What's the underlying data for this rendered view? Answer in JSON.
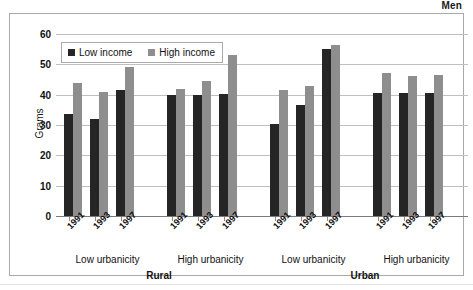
{
  "chart_data": {
    "type": "bar",
    "title": "Men",
    "xlabel": "",
    "ylabel": "Grams",
    "ylim": [
      0,
      60
    ],
    "ytick_step": 10,
    "yticks": [
      "0",
      "10",
      "20",
      "30",
      "40",
      "50",
      "60"
    ],
    "grid": true,
    "legend_position": "top-left-inside",
    "legend": [
      "Low income",
      "High income"
    ],
    "colors": {
      "low_income": "#252525",
      "high_income": "#8e8e8e",
      "gridline": "#bfbfbf",
      "frame": "#a9a9a9",
      "text": "#111111"
    },
    "categories": [
      "1991",
      "1993",
      "1997",
      "1991",
      "1993",
      "1997",
      "1991",
      "1993",
      "1997",
      "1991",
      "1993",
      "1997"
    ],
    "series": [
      {
        "name": "Low income",
        "values": [
          33.5,
          32.0,
          41.5,
          40.0,
          40.0,
          40.2,
          30.2,
          36.5,
          55.0,
          40.5,
          40.5,
          40.5
        ]
      },
      {
        "name": "High income",
        "values": [
          44.0,
          40.8,
          49.0,
          41.8,
          44.5,
          53.0,
          41.7,
          43.0,
          56.3,
          47.0,
          46.0,
          46.5
        ]
      }
    ],
    "groups": [
      {
        "area": "Rural",
        "urbanicity": "Low urbanicity",
        "years": [
          "1991",
          "1993",
          "1997"
        ],
        "low_income": [
          33.5,
          32.0,
          41.5
        ],
        "high_income": [
          44.0,
          40.8,
          49.0
        ]
      },
      {
        "area": "Rural",
        "urbanicity": "High urbanicity",
        "years": [
          "1991",
          "1993",
          "1997"
        ],
        "low_income": [
          40.0,
          40.0,
          40.2
        ],
        "high_income": [
          41.8,
          44.5,
          53.0
        ]
      },
      {
        "area": "Urban",
        "urbanicity": "Low urbanicity",
        "years": [
          "1991",
          "1993",
          "1997"
        ],
        "low_income": [
          30.2,
          36.5,
          55.0
        ],
        "high_income": [
          41.7,
          43.0,
          56.3
        ]
      },
      {
        "area": "Urban",
        "urbanicity": "High urbanicity",
        "years": [
          "1991",
          "1993",
          "1997"
        ],
        "low_income": [
          40.5,
          40.5,
          40.5
        ],
        "high_income": [
          47.0,
          46.0,
          46.5
        ]
      }
    ],
    "urbanicity_labels": [
      "Low urbanicity",
      "High urbanicity",
      "Low urbanicity",
      "High urbanicity"
    ],
    "area_labels": [
      "Rural",
      "Urban"
    ]
  }
}
